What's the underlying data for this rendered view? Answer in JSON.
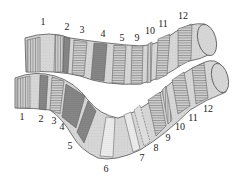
{
  "figure": {
    "colors": {
      "chromosome_fill": "#d8d8d8",
      "band_dark": "#8a8a8a",
      "band_medium": "#b4b4b4",
      "stroke": "#555555",
      "stipple": "#f0f0f0"
    },
    "upper_chromosome": {
      "labels": [
        {
          "text": "1",
          "x": 43,
          "y": 22
        },
        {
          "text": "2",
          "x": 67,
          "y": 27
        },
        {
          "text": "3",
          "x": 82,
          "y": 30
        },
        {
          "text": "4",
          "x": 103,
          "y": 34
        },
        {
          "text": "5",
          "x": 122,
          "y": 38
        },
        {
          "text": "9",
          "x": 137,
          "y": 38
        },
        {
          "text": "10",
          "x": 150,
          "y": 31
        },
        {
          "text": "11",
          "x": 163,
          "y": 24
        },
        {
          "text": "12",
          "x": 183,
          "y": 16
        }
      ]
    },
    "lower_chromosome": {
      "labels": [
        {
          "text": "1",
          "x": 22,
          "y": 117
        },
        {
          "text": "2",
          "x": 41,
          "y": 119
        },
        {
          "text": "3",
          "x": 54,
          "y": 121
        },
        {
          "text": "4",
          "x": 62,
          "y": 127
        },
        {
          "text": "5",
          "x": 70,
          "y": 146
        },
        {
          "text": "6",
          "x": 106,
          "y": 169
        },
        {
          "text": "7",
          "x": 142,
          "y": 158
        },
        {
          "text": "8",
          "x": 156,
          "y": 148
        },
        {
          "text": "9",
          "x": 168,
          "y": 138
        },
        {
          "text": "10",
          "x": 180,
          "y": 127
        },
        {
          "text": "11",
          "x": 193,
          "y": 118
        },
        {
          "text": "12",
          "x": 208,
          "y": 109
        }
      ]
    }
  }
}
